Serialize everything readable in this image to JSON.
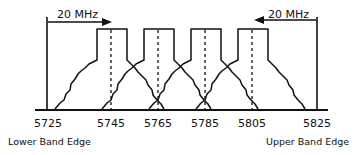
{
  "diagram": {
    "bandwidth_left_label": "20 MHz",
    "bandwidth_right_label": "20 MHz",
    "frequency_ticks": [
      "5725",
      "5745",
      "5765",
      "5785",
      "5805",
      "5825"
    ],
    "lower_edge_label": "Lower Band Edge",
    "upper_edge_label": "Upper Band Edge",
    "channel_centers_mhz": [
      5745,
      5765,
      5785,
      5805
    ],
    "colors": {
      "line": "#111111",
      "background": "#ffffff"
    }
  }
}
